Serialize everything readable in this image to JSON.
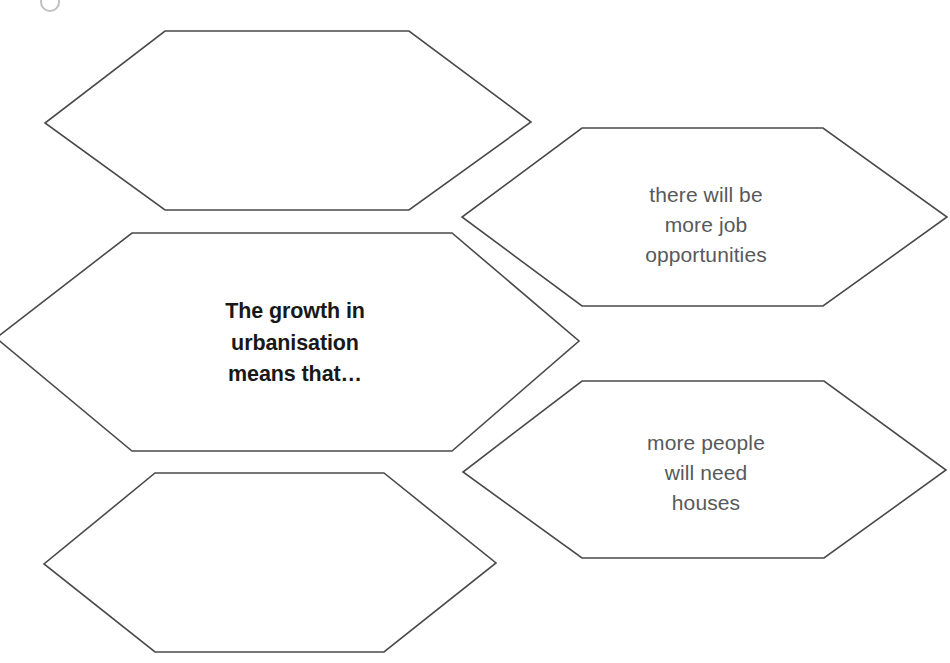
{
  "page": {
    "background_color": "#ffffff",
    "outline_color": "#4a4a4a",
    "prompt_text_color": "#181818",
    "answer_text_color": "#58595b"
  },
  "diagram": {
    "type": "hexagon-cluster",
    "hexagons": [
      {
        "id": "blank-top-left",
        "role": "blank-answer",
        "text": "",
        "filled": false
      },
      {
        "id": "prompt-center-left",
        "role": "prompt",
        "text": "The growth in urbanisation means that…",
        "lines": [
          "The growth in",
          "urbanisation",
          "means that…"
        ],
        "filled": true,
        "bold": true
      },
      {
        "id": "blank-bottom-left",
        "role": "blank-answer",
        "text": "",
        "filled": false
      },
      {
        "id": "answer-jobs",
        "role": "answer",
        "text": "there will be more job opportunities",
        "lines": [
          "there will be",
          "more job",
          "opportunities"
        ],
        "filled": true,
        "bold": false
      },
      {
        "id": "answer-houses",
        "role": "answer",
        "text": "more people will need houses",
        "lines": [
          "more people",
          "will need",
          "houses"
        ],
        "filled": true,
        "bold": false
      },
      {
        "id": "blank-right-partial",
        "role": "blank-answer",
        "text": "",
        "filled": false
      }
    ]
  },
  "labels": {
    "center_prompt": "The growth in\nurbanisation\nmeans that…",
    "jobs_answer": "there will be\nmore job\nopportunities",
    "houses_answer": "more people\nwill need\nhouses"
  }
}
